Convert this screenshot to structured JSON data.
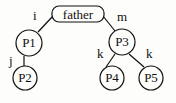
{
  "diagram": {
    "type": "tree",
    "root": {
      "id": "father",
      "label": "father",
      "shape": "rounded-rect"
    },
    "nodes": [
      {
        "id": "P1",
        "label": "P1",
        "shape": "circle"
      },
      {
        "id": "P2",
        "label": "P2",
        "shape": "circle"
      },
      {
        "id": "P3",
        "label": "P3",
        "shape": "circle"
      },
      {
        "id": "P4",
        "label": "P4",
        "shape": "circle"
      },
      {
        "id": "P5",
        "label": "P5",
        "shape": "circle"
      }
    ],
    "edges": [
      {
        "from": "father",
        "to": "P1",
        "label": "i"
      },
      {
        "from": "father",
        "to": "P3",
        "label": "m"
      },
      {
        "from": "P1",
        "to": "P2",
        "label": "j"
      },
      {
        "from": "P3",
        "to": "P4",
        "label": "k"
      },
      {
        "from": "P3",
        "to": "P5",
        "label": "k"
      }
    ]
  }
}
